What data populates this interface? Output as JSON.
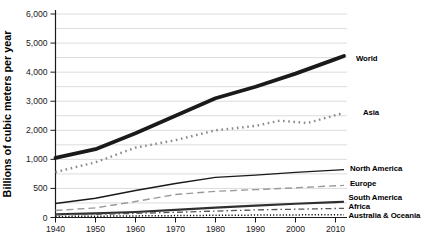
{
  "chart_data": {
    "type": "line",
    "title": "",
    "ylabel": "Billions of cubic meters per year",
    "xlabel": "",
    "grid": "horizontal",
    "legend_position": "labels-at-line-ends-right",
    "y_axis": {
      "scale_note": "tick levels are evenly spaced on the axis (non-linear value scale)",
      "tick_values": [
        0,
        500,
        1000,
        2000,
        3000,
        4000,
        5000,
        6000
      ],
      "tick_labels": [
        "0",
        "500",
        "1,000",
        "2,000",
        "3,000",
        "4,000",
        "5,000",
        "6,000"
      ]
    },
    "x_axis": {
      "tick_values": [
        1940,
        1950,
        1960,
        1970,
        1980,
        1990,
        2000,
        2010
      ],
      "tick_labels": [
        "1940",
        "1950",
        "1960",
        "1970",
        "1980",
        "1990",
        "2000",
        "2010"
      ]
    },
    "x": [
      1940,
      1950,
      1960,
      1970,
      1980,
      1990,
      2000,
      2010
    ],
    "series": [
      {
        "name": "World",
        "style": "solid-thick",
        "color": "#1a1a1a",
        "values": [
          1050,
          1350,
          1900,
          2500,
          3100,
          3500,
          3950,
          4450
        ]
      },
      {
        "name": "Asia",
        "style": "dotted",
        "color": "#8a8a8a",
        "x": [
          1940,
          1950,
          1960,
          1970,
          1980,
          1990,
          1996,
          2003,
          2010
        ],
        "values": [
          780,
          950,
          1400,
          1660,
          2000,
          2150,
          2330,
          2250,
          2520
        ]
      },
      {
        "name": "North America",
        "style": "solid",
        "color": "#1a1a1a",
        "values": [
          240,
          330,
          465,
          585,
          690,
          730,
          775,
          815
        ]
      },
      {
        "name": "Europe",
        "style": "dashed",
        "color": "#9a9a9a",
        "values": [
          120,
          165,
          275,
          395,
          450,
          480,
          510,
          545
        ]
      },
      {
        "name": "South America",
        "style": "solid-medium",
        "color": "#2f2f2f",
        "values": [
          55,
          70,
          95,
          130,
          170,
          205,
          235,
          265
        ]
      },
      {
        "name": "Africa",
        "style": "dashdot",
        "color": "#555555",
        "values": [
          45,
          55,
          70,
          90,
          110,
          130,
          142,
          155
        ]
      },
      {
        "name": "Australia & Oceania",
        "style": "fine-dotted",
        "color": "#111111",
        "values": [
          18,
          22,
          27,
          32,
          37,
          42,
          45,
          48
        ]
      }
    ]
  },
  "colors": {
    "background": "#ffffff",
    "gridline": "#dcdcdc",
    "axis": "#1a1a1a",
    "tick_text": "#1a1a1a"
  }
}
